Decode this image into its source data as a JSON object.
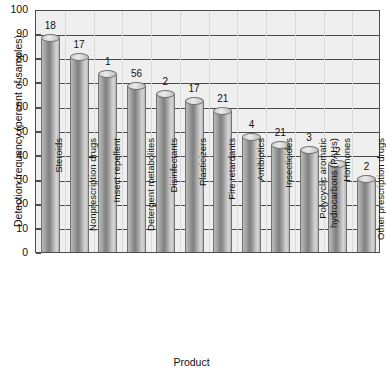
{
  "chart_data": {
    "type": "bar",
    "title": "",
    "xlabel": "Product",
    "ylabel": "Detection frequency (percent of samples)",
    "ylim": [
      0,
      100
    ],
    "ytick_step": 10,
    "grid": true,
    "legend": "none",
    "orientation": "vertical",
    "bar_style": "3d-cylinder",
    "categories": [
      "Steroids",
      "Nonprescription drugs",
      "Insect repellent",
      "Detergent metabolites",
      "Disinfectants",
      "Plasticizers",
      "Fire retardants",
      "Antibiotics",
      "Insecticides",
      "Polycyclic aromatic hydrocarbons (PAHs)",
      "Hormones",
      "Other prescription drugs"
    ],
    "values": [
      89,
      81,
      74,
      69,
      66,
      63,
      59,
      48,
      45,
      43,
      37,
      31
    ],
    "point_labels": [
      "18",
      "17",
      "1",
      "56",
      "2",
      "17",
      "21",
      "4",
      "21",
      "3",
      "2",
      "2"
    ],
    "ytick_labels": [
      "0",
      "10",
      "20",
      "30",
      "40",
      "50",
      "60",
      "70",
      "80",
      "90",
      "100"
    ]
  },
  "colors": {
    "plot_background": "#efefef",
    "page_background": "#ffffff",
    "gridline": "#4a4a4a",
    "axis": "#4d4d4d",
    "bar_light": "#d6d6d6",
    "bar_dark": "#7f7f7f",
    "text": "#111111"
  }
}
